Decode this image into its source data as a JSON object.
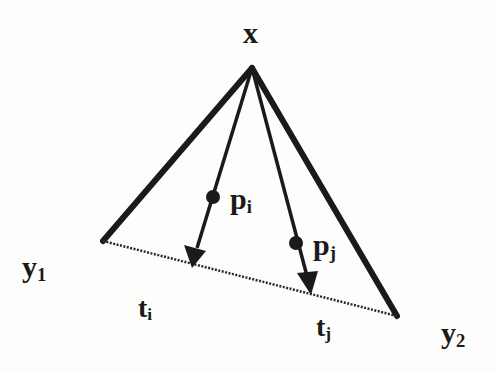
{
  "diagram": {
    "type": "geometric-projection",
    "colors": {
      "ink": "#1a1a1a",
      "background": "#fdfdfb"
    },
    "labels": {
      "apex": "x",
      "point_i": {
        "base": "p",
        "sub": "i"
      },
      "point_j": {
        "base": "p",
        "sub": "j"
      },
      "left_end": {
        "base": "y",
        "sub": "1"
      },
      "right_end": {
        "base": "y",
        "sub": "2"
      },
      "target_i": {
        "base": "t",
        "sub": "i"
      },
      "target_j": {
        "base": "t",
        "sub": "j"
      }
    },
    "nodes": {
      "x": [
        252,
        68
      ],
      "y1": [
        103,
        241
      ],
      "y2": [
        397,
        316
      ],
      "p_i": [
        213,
        197
      ],
      "p_j": [
        296,
        243
      ],
      "t_i": [
        192,
        266
      ],
      "t_j": [
        311,
        294
      ]
    },
    "edges": [
      {
        "from": "x",
        "to": "y1",
        "style": "thick-solid"
      },
      {
        "from": "x",
        "to": "y2",
        "style": "thick-solid"
      },
      {
        "from": "x",
        "to": "t_i",
        "style": "thin-arrow",
        "through": "p_i"
      },
      {
        "from": "x",
        "to": "t_j",
        "style": "thin-arrow",
        "through": "p_j"
      },
      {
        "from": "y1",
        "to": "y2",
        "style": "dotted"
      }
    ]
  }
}
